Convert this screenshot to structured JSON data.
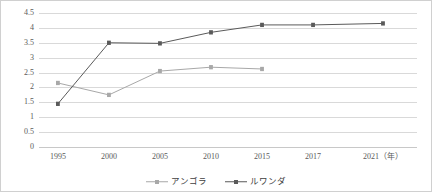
{
  "chart_data": {
    "type": "line",
    "title": "",
    "xlabel": "年",
    "ylabel": "",
    "categories": [
      "1995",
      "2000",
      "2005",
      "2010",
      "2015",
      "2017",
      "2021"
    ],
    "x_tick_labels": [
      "1995",
      "2000",
      "2005",
      "2010",
      "2015",
      "2017",
      "2021（年）"
    ],
    "x_positions_pct": [
      5,
      18.5,
      32,
      45.5,
      59,
      72.5,
      91
    ],
    "ylim": [
      0,
      4.5
    ],
    "ytick_labels": [
      "0",
      "0.5",
      "1",
      "1.5",
      "2",
      "2.5",
      "3",
      "3.5",
      "4",
      "4.5"
    ],
    "ytick_values": [
      0,
      0.5,
      1,
      1.5,
      2,
      2.5,
      3,
      3.5,
      4,
      4.5
    ],
    "grid": true,
    "grid_axis": "y",
    "legend_position": "bottom-center",
    "series": [
      {
        "name": "アンゴラ",
        "color": "#a8a8a8",
        "marker": "square",
        "values": [
          2.15,
          1.75,
          2.55,
          2.68,
          2.62,
          null,
          null
        ]
      },
      {
        "name": "ルワンダ",
        "color": "#5a5a5a",
        "marker": "diamond",
        "values": [
          1.45,
          3.5,
          3.48,
          3.85,
          4.1,
          4.1,
          4.15
        ]
      }
    ]
  },
  "legend": {
    "items": [
      {
        "label": "アンゴラ",
        "color": "#a8a8a8"
      },
      {
        "label": "ルワンダ",
        "color": "#5a5a5a"
      }
    ]
  },
  "colors": {
    "angola": "#a8a8a8",
    "rwanda": "#5a5a5a",
    "gridline": "#d9d9d9",
    "axis_text": "#5a5a5a",
    "border": "#d0d0d0"
  }
}
